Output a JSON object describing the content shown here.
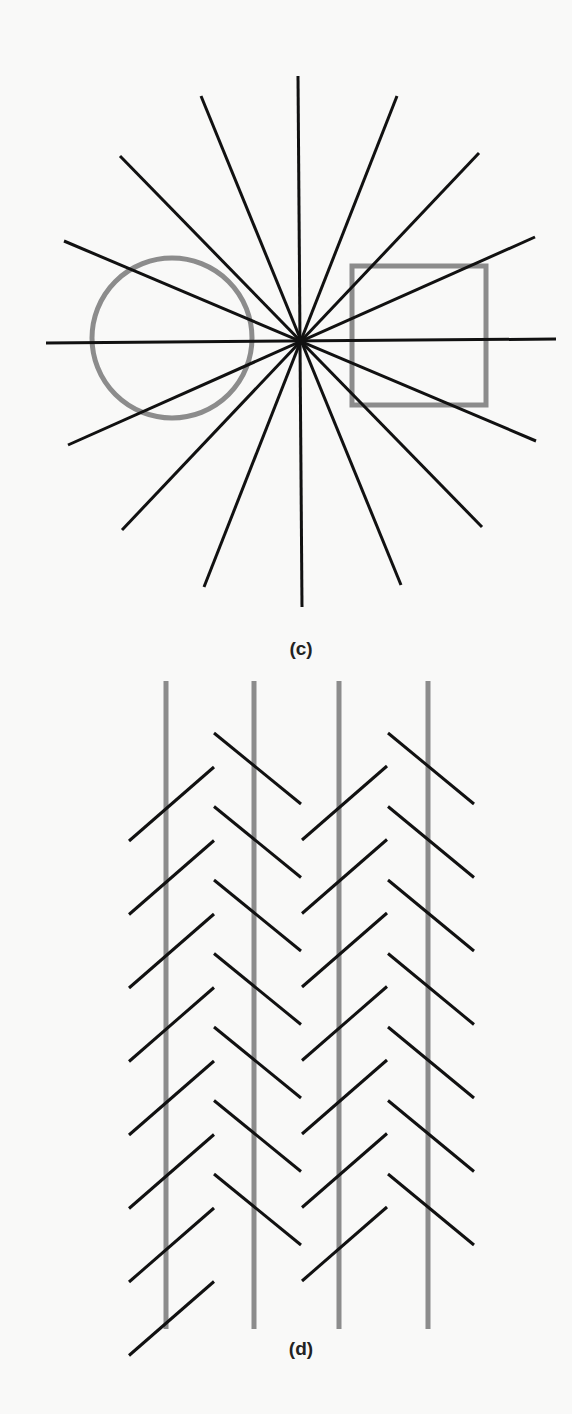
{
  "figure_c": {
    "label": "(c)",
    "label_pos": [
      301,
      650
    ],
    "title": "Hering-type radiating lines illusion with circle and square",
    "center": [
      300,
      341
    ],
    "ray_color": "#111111",
    "ray_width": 3,
    "rays": [
      [
        298,
        76,
        302,
        607
      ],
      [
        201,
        96,
        401,
        585
      ],
      [
        120,
        156,
        482,
        527
      ],
      [
        64,
        241,
        536,
        441
      ],
      [
        46,
        343,
        556,
        339
      ],
      [
        68,
        445,
        535,
        237
      ],
      [
        122,
        530,
        479,
        153
      ],
      [
        204,
        587,
        397,
        96
      ]
    ],
    "circle": {
      "cx": 172,
      "cy": 338,
      "r": 80,
      "color": "#8c8c8c",
      "stroke_width": 5
    },
    "square": {
      "x": 352,
      "y": 266,
      "w": 134,
      "h": 139,
      "color": "#8c8c8c",
      "stroke_width": 5
    }
  },
  "figure_d": {
    "label": "(d)",
    "label_pos": [
      301,
      1350
    ],
    "title": "Zöllner illusion with parallel vertical lines and oblique hatches",
    "vertical_color": "#8c8c8c",
    "vertical_width": 5,
    "verticals": [
      {
        "x": 166,
        "y1": 681,
        "y2": 1329
      },
      {
        "x": 254,
        "y1": 681,
        "y2": 1329
      },
      {
        "x": 339,
        "y1": 681,
        "y2": 1329
      },
      {
        "x": 428,
        "y1": 681,
        "y2": 1329
      }
    ],
    "hatch_color": "#111111",
    "hatch_width": 3,
    "hatch_columns": [
      {
        "direction": "up-right",
        "x1": 129,
        "x2": 214,
        "y_start": 841,
        "count": 8,
        "step": 73.5,
        "dy": -74
      },
      {
        "direction": "down-right",
        "x1": 214,
        "x2": 301,
        "y_start": 733,
        "count": 7,
        "step": 73.5,
        "dy": 71
      },
      {
        "direction": "up-right",
        "x1": 302,
        "x2": 387,
        "y_start": 840,
        "count": 7,
        "step": 73.5,
        "dy": -74
      },
      {
        "direction": "down-right",
        "x1": 388,
        "x2": 474,
        "y_start": 733,
        "count": 7,
        "step": 73.5,
        "dy": 71
      }
    ]
  }
}
